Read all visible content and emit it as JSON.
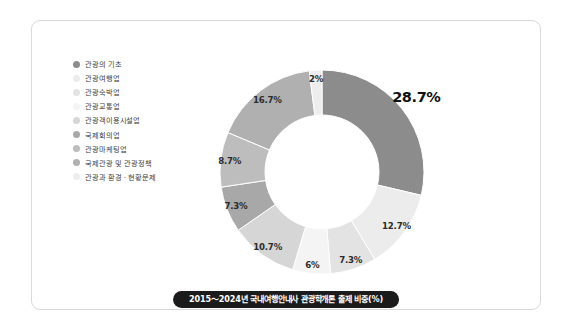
{
  "caption": "2015～2024년 국내여행안내사 관광학개론 출제 비중(%)",
  "legend": {
    "items": [
      {
        "label": "관광의 기초",
        "color": "#8c8c8c"
      },
      {
        "label": "관광여행업",
        "color": "#ececec"
      },
      {
        "label": "관광숙박업",
        "color": "#e3e3e3"
      },
      {
        "label": "관광교통업",
        "color": "#f4f4f4"
      },
      {
        "label": "관광객이용시설업",
        "color": "#d6d6d6"
      },
      {
        "label": "국제회의업",
        "color": "#a8a8a8"
      },
      {
        "label": "관광마케팅업",
        "color": "#bdbdbd"
      },
      {
        "label": "국제관광 및 관광정책",
        "color": "#b0b0b0"
      },
      {
        "label": "관광과 환경 · 현황문제",
        "color": "#ededed"
      }
    ]
  },
  "chart_data": {
    "type": "pie",
    "variant": "donut",
    "title": "2015～2024년 국내여행안내사 관광학개론 출제 비중(%)",
    "unit": "%",
    "start_angle_deg": 0,
    "direction": "clockwise",
    "legend_position": "left",
    "categories": [
      "관광의 기초",
      "관광여행업",
      "관광숙박업",
      "관광교통업",
      "관광객이용시설업",
      "국제회의업",
      "관광마케팅업",
      "국제관광 및 관광정책",
      "관광과 환경 · 현황문제"
    ],
    "values": [
      28.7,
      12.7,
      7.3,
      6,
      10.7,
      7.3,
      8.7,
      16.7,
      2
    ],
    "labels": [
      "28.7%",
      "12.7%",
      "7.3%",
      "6%",
      "10.7%",
      "7.3%",
      "8.7%",
      "16.7%",
      "2%"
    ],
    "colors": [
      "#8c8c8c",
      "#ececec",
      "#e3e3e3",
      "#f4f4f4",
      "#d6d6d6",
      "#a8a8a8",
      "#bdbdbd",
      "#b0b0b0",
      "#ededed"
    ],
    "slices": [
      {
        "name": "관광의 기초",
        "value": 28.7,
        "label": "28.7%",
        "color": "#8c8c8c",
        "emphasis": true
      },
      {
        "name": "관광여행업",
        "value": 12.7,
        "label": "12.7%",
        "color": "#ececec",
        "emphasis": false
      },
      {
        "name": "관광숙박업",
        "value": 7.3,
        "label": "7.3%",
        "color": "#e3e3e3",
        "emphasis": false
      },
      {
        "name": "관광교통업",
        "value": 6,
        "label": "6%",
        "color": "#f4f4f4",
        "emphasis": false
      },
      {
        "name": "관광객이용시설업",
        "value": 10.7,
        "label": "10.7%",
        "color": "#d6d6d6",
        "emphasis": false
      },
      {
        "name": "국제회의업",
        "value": 7.3,
        "label": "7.3%",
        "color": "#a8a8a8",
        "emphasis": false
      },
      {
        "name": "관광마케팅업",
        "value": 8.7,
        "label": "8.7%",
        "color": "#bdbdbd",
        "emphasis": false
      },
      {
        "name": "국제관광 및 관광정책",
        "value": 16.7,
        "label": "16.7%",
        "color": "#b0b0b0",
        "emphasis": false
      },
      {
        "name": "관광과 환경 · 현황문제",
        "value": 2,
        "label": "2%",
        "color": "#ededed",
        "emphasis": false
      }
    ]
  }
}
